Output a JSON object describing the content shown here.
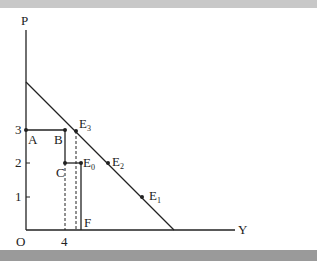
{
  "diagram": {
    "axis_labels": {
      "y": "P",
      "x": "Y",
      "origin": "O"
    },
    "y_ticks": [
      "1",
      "2",
      "3"
    ],
    "x_ticks": [
      "4"
    ],
    "points": {
      "A": "A",
      "B": "B",
      "C": "C",
      "F": "F",
      "E0": {
        "base": "E",
        "sub": "0"
      },
      "E1": {
        "base": "E",
        "sub": "1"
      },
      "E2": {
        "base": "E",
        "sub": "2"
      },
      "E3": {
        "base": "E",
        "sub": "3"
      }
    },
    "colors": {
      "line": "#222222",
      "top_bar": "#c8c8c8",
      "bottom_bar": "#9a9a9a"
    }
  }
}
